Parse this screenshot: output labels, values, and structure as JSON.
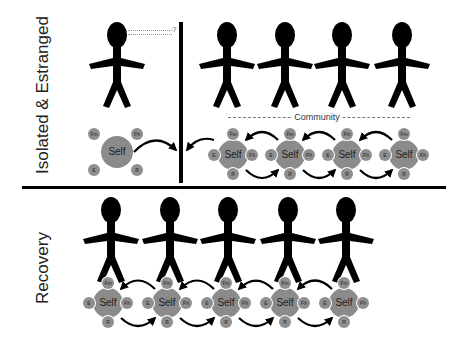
{
  "labels": {
    "top_section": "Isolated & Estranged",
    "bottom_section": "Recovery",
    "community": "Community",
    "question_mark": "?"
  },
  "node_labels": {
    "self": "Self",
    "family": "Fm",
    "friends": "Fh",
    "employment": "E",
    "recreation": "R"
  },
  "colors": {
    "figure": "#000000",
    "node_fill": "#8b8b8b",
    "text": "#222222",
    "divider": "#000000"
  },
  "top": {
    "isolated_figure": {
      "x": 117,
      "y": 70
    },
    "isolated_self": {
      "x": 117,
      "y": 152
    },
    "community_figures": [
      {
        "x": 227
      },
      {
        "x": 285
      },
      {
        "x": 342
      },
      {
        "x": 402
      }
    ],
    "community_selves": [
      {
        "x": 233
      },
      {
        "x": 290
      },
      {
        "x": 347
      },
      {
        "x": 404
      }
    ]
  },
  "bottom": {
    "figures": [
      {
        "x": 111
      },
      {
        "x": 170
      },
      {
        "x": 228
      },
      {
        "x": 288
      },
      {
        "x": 346
      }
    ],
    "selves": [
      {
        "x": 108
      },
      {
        "x": 167
      },
      {
        "x": 226
      },
      {
        "x": 285
      },
      {
        "x": 344
      }
    ]
  }
}
